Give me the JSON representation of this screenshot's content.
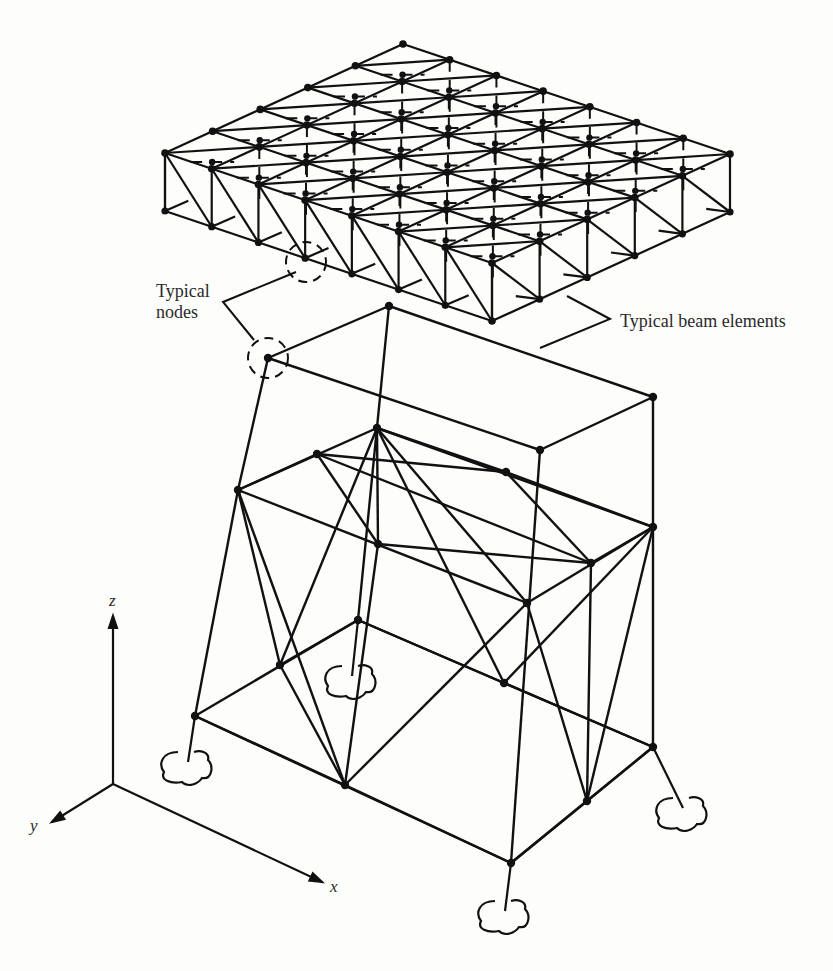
{
  "figure": {
    "labels": {
      "typical_nodes_line1": "Typical",
      "typical_nodes_line2": "nodes",
      "typical_beam_elements": "Typical beam elements"
    },
    "axes": {
      "x": "x",
      "y": "y",
      "z": "z"
    },
    "colors": {
      "ink": "#111111",
      "background": "#fdfdfc",
      "text": "#2a2a2a"
    }
  },
  "grid": {
    "top_corner": [
      403,
      44
    ],
    "vec_x": [
      46.7,
      15.7
    ],
    "vec_y": [
      -47.6,
      -21.8
    ],
    "divisions_x": 7,
    "divisions_y": 5,
    "left_corner": [
      165,
      153
    ],
    "depth": 58
  },
  "frame": {
    "nodes": {
      "A": [
        268,
        358
      ],
      "B": [
        389,
        306
      ],
      "C": [
        653,
        397
      ],
      "D": [
        540,
        450
      ],
      "E": [
        238,
        490
      ],
      "F": [
        317,
        454
      ],
      "G": [
        377,
        428
      ],
      "H": [
        506,
        472
      ],
      "I": [
        378,
        544
      ],
      "J": [
        527,
        603
      ],
      "K": [
        591,
        563
      ],
      "L": [
        653,
        527
      ],
      "M": [
        195,
        716
      ],
      "N": [
        280,
        665
      ],
      "O": [
        358,
        620
      ],
      "P": [
        345,
        785
      ],
      "Q": [
        504,
        683
      ],
      "S": [
        653,
        747
      ],
      "T": [
        587,
        801
      ],
      "U": [
        511,
        863
      ]
    },
    "members": [
      [
        "A",
        "B"
      ],
      [
        "B",
        "C"
      ],
      [
        "C",
        "D"
      ],
      [
        "D",
        "A"
      ],
      [
        "E",
        "G"
      ],
      [
        "G",
        "L"
      ],
      [
        "L",
        "J"
      ],
      [
        "J",
        "E"
      ],
      [
        "E",
        "F"
      ],
      [
        "F",
        "H"
      ],
      [
        "H",
        "L"
      ],
      [
        "G",
        "I"
      ],
      [
        "I",
        "K"
      ],
      [
        "K",
        "L"
      ],
      [
        "F",
        "I"
      ],
      [
        "F",
        "K"
      ],
      [
        "G",
        "J"
      ],
      [
        "G",
        "H"
      ],
      [
        "H",
        "K"
      ],
      [
        "M",
        "O"
      ],
      [
        "O",
        "S"
      ],
      [
        "S",
        "U"
      ],
      [
        "U",
        "M"
      ],
      [
        "M",
        "P"
      ],
      [
        "P",
        "U"
      ],
      [
        "P",
        "N"
      ],
      [
        "N",
        "O"
      ],
      [
        "O",
        "Q"
      ],
      [
        "Q",
        "S"
      ],
      [
        "T",
        "S"
      ],
      [
        "T",
        "U"
      ],
      [
        "A",
        "E"
      ],
      [
        "E",
        "M"
      ],
      [
        "B",
        "O"
      ],
      [
        "C",
        "S"
      ],
      [
        "D",
        "U"
      ],
      [
        "E",
        "N"
      ],
      [
        "E",
        "P"
      ],
      [
        "G",
        "N"
      ],
      [
        "J",
        "T"
      ],
      [
        "L",
        "T"
      ],
      [
        "L",
        "Q"
      ],
      [
        "J",
        "P"
      ],
      [
        "G",
        "Q"
      ],
      [
        "K",
        "T"
      ],
      [
        "I",
        "P"
      ]
    ],
    "supports": [
      [
        188,
        766
      ],
      [
        352,
        680
      ],
      [
        683,
        812
      ],
      [
        505,
        915
      ]
    ],
    "highlight_circles": [
      [
        306,
        262
      ],
      [
        268,
        358
      ]
    ]
  },
  "axes_origin": [
    113,
    784
  ],
  "axis_ends": {
    "z": [
      113,
      616
    ],
    "y": [
      36,
      826
    ],
    "x": [
      322,
      882
    ]
  }
}
